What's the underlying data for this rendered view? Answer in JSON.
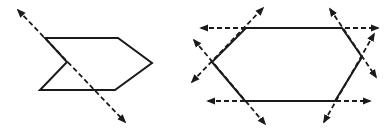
{
  "figures": [
    {
      "name": "arrow-pentagon",
      "description": "Concave arrow-shaped polygon with one dashed line of symmetry",
      "polygon": [
        [
          45,
          38
        ],
        [
          118,
          38
        ],
        [
          152,
          63
        ],
        [
          115,
          90
        ],
        [
          40,
          90
        ],
        [
          67,
          62
        ]
      ],
      "symmetry_lines": [
        {
          "from": [
            18,
            10
          ],
          "to": [
            125,
            122
          ]
        }
      ]
    },
    {
      "name": "hexagon",
      "description": "Hexagon with dashed double-headed lines extending each side",
      "polygon": [
        [
          246,
          28
        ],
        [
          342,
          28
        ],
        [
          362,
          57
        ],
        [
          335,
          101
        ],
        [
          245,
          101
        ],
        [
          212,
          62
        ]
      ],
      "symmetry_lines": [
        {
          "from": [
            201,
            28
          ],
          "to": [
            378,
            28
          ]
        },
        {
          "from": [
            208,
            101
          ],
          "to": [
            370,
            101
          ]
        },
        {
          "from": [
            192,
            82
          ],
          "to": [
            263,
            8
          ]
        },
        {
          "from": [
            194,
            40
          ],
          "to": [
            265,
            124
          ]
        },
        {
          "from": [
            330,
            9
          ],
          "to": [
            376,
            77
          ]
        },
        {
          "from": [
            324,
            122
          ],
          "to": [
            374,
            34
          ]
        }
      ]
    }
  ],
  "colors": {
    "stroke": "#1a1a1a",
    "background": "#ffffff"
  }
}
